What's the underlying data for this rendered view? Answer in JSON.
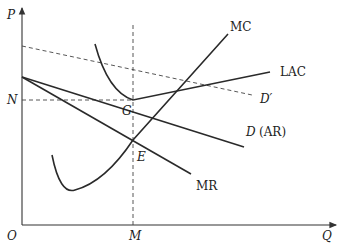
{
  "diagram": {
    "axes": {
      "y_label": "P",
      "x_label": "Q",
      "origin_label": "O"
    },
    "points": {
      "N": "N",
      "M": "M",
      "G": "G",
      "E": "E"
    },
    "curves": {
      "mc": "MC",
      "lac": "LAC",
      "d_prime": "D′",
      "d_ar_italic": "D",
      "d_ar_paren": "(AR)",
      "mr": "MR"
    }
  },
  "colors": {
    "line": "#2a2a2a",
    "background": "#ffffff"
  }
}
